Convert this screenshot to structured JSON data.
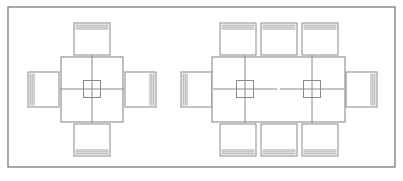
{
  "drawing": {
    "title": "Furniture Layout Plan",
    "description": "Top-down CAD plan of two dining table arrangements with chairs",
    "background_color": "#ffffff",
    "line_color": "#8a8a8a",
    "frame_color": "#6e6e6e",
    "canvas": {
      "width": 403,
      "height": 181
    }
  },
  "frame": {
    "label": "drawing-border",
    "x": 8,
    "y": 7,
    "width": 387,
    "height": 160
  },
  "arrangements": [
    {
      "id": "square-table-group",
      "label": "Square table with 4 chairs",
      "seat_count": 4,
      "table": {
        "label": "square-table",
        "shape": "square",
        "x": 61,
        "y": 57,
        "width": 62,
        "height": 65
      },
      "center_markers": [
        {
          "label": "center-marker",
          "cx": 92,
          "cy": 89,
          "box": 17,
          "arm_h": 32,
          "arm_v": 34
        }
      ],
      "chairs": [
        {
          "label": "chair-north",
          "side": "top",
          "x": 74,
          "y": 23,
          "width": 36,
          "height": 32
        },
        {
          "label": "chair-south",
          "side": "bottom",
          "x": 74,
          "y": 124,
          "width": 36,
          "height": 32
        },
        {
          "label": "chair-west",
          "side": "left",
          "x": 28,
          "y": 72,
          "width": 31,
          "height": 35
        },
        {
          "label": "chair-east",
          "side": "right",
          "x": 125,
          "y": 72,
          "width": 31,
          "height": 35
        }
      ]
    },
    {
      "id": "rect-table-group",
      "label": "Rectangular table with 8 chairs",
      "seat_count": 8,
      "table": {
        "label": "rectangular-table",
        "shape": "rectangle",
        "x": 212,
        "y": 57,
        "width": 133,
        "height": 65
      },
      "center_markers": [
        {
          "label": "center-marker-left",
          "cx": 245,
          "cy": 89,
          "box": 17,
          "arm_h": 32,
          "arm_v": 34
        },
        {
          "label": "center-marker-right",
          "cx": 312,
          "cy": 89,
          "box": 17,
          "arm_h": 32,
          "arm_v": 34
        }
      ],
      "chairs": [
        {
          "label": "chair-north-1",
          "side": "top",
          "x": 220,
          "y": 23,
          "width": 36,
          "height": 32
        },
        {
          "label": "chair-north-2",
          "side": "top",
          "x": 261,
          "y": 23,
          "width": 36,
          "height": 32
        },
        {
          "label": "chair-north-3",
          "side": "top",
          "x": 302,
          "y": 23,
          "width": 36,
          "height": 32
        },
        {
          "label": "chair-south-1",
          "side": "bottom",
          "x": 220,
          "y": 124,
          "width": 36,
          "height": 32
        },
        {
          "label": "chair-south-2",
          "side": "bottom",
          "x": 261,
          "y": 124,
          "width": 36,
          "height": 32
        },
        {
          "label": "chair-south-3",
          "side": "bottom",
          "x": 302,
          "y": 124,
          "width": 36,
          "height": 32
        },
        {
          "label": "chair-west",
          "side": "left",
          "x": 181,
          "y": 72,
          "width": 31,
          "height": 35
        },
        {
          "label": "chair-east",
          "side": "right",
          "x": 346,
          "y": 72,
          "width": 31,
          "height": 35
        }
      ]
    }
  ]
}
